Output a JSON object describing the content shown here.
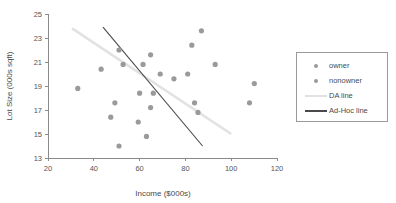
{
  "chart_data": {
    "type": "scatter",
    "title": "",
    "xlabel": "Income ($000s)",
    "ylabel": "Lot Size (000s sqft)",
    "xlim": [
      20,
      120
    ],
    "ylim": [
      13,
      25
    ],
    "xticks": [
      20,
      40,
      60,
      80,
      100,
      120
    ],
    "yticks": [
      13,
      15,
      17,
      19,
      21,
      23,
      25
    ],
    "grid": false,
    "legend_position": "right-outside",
    "series": [
      {
        "name": "owner",
        "marker": "circle",
        "color": "#9a9a9a",
        "points": [
          [
            60.0,
            18.4
          ],
          [
            85.5,
            16.8
          ],
          [
            64.8,
            21.6
          ],
          [
            61.5,
            20.8
          ],
          [
            87.0,
            23.6
          ],
          [
            110.1,
            19.2
          ],
          [
            108.0,
            17.6
          ],
          [
            82.8,
            22.4
          ],
          [
            69.0,
            20.0
          ],
          [
            93.0,
            20.8
          ],
          [
            51.0,
            22.0
          ],
          [
            81.0,
            20.0
          ]
        ]
      },
      {
        "name": "nonowner",
        "marker": "circle",
        "color": "#9a9a9a",
        "points": [
          [
            75.0,
            19.6
          ],
          [
            52.8,
            20.8
          ],
          [
            64.8,
            17.2
          ],
          [
            43.2,
            20.4
          ],
          [
            84.0,
            17.6
          ],
          [
            49.2,
            17.6
          ],
          [
            59.4,
            16.0
          ],
          [
            66.0,
            18.4
          ],
          [
            47.4,
            16.4
          ],
          [
            33.0,
            18.8
          ],
          [
            51.0,
            14.0
          ],
          [
            63.0,
            14.8
          ]
        ]
      }
    ],
    "lines": [
      {
        "name": "DA line",
        "color": "#e2e2e2",
        "width": 2.6,
        "x0": 30.5,
        "y0": 23.8,
        "x1": 100.0,
        "y1": 15.0
      },
      {
        "name": "Ad-Hoc line",
        "color": "#4a4a4a",
        "width": 1.1,
        "x0": 44.0,
        "y0": 23.9,
        "x1": 87.5,
        "y1": 14.0
      }
    ]
  },
  "legend": {
    "items": [
      {
        "label": "owner",
        "key": "dot",
        "color": "#9a9a9a"
      },
      {
        "label": "nonowner",
        "key": "dot",
        "color": "#9a9a9a"
      },
      {
        "label": "DA line",
        "key": "line",
        "color": "#e2e2e2"
      },
      {
        "label": "Ad-Hoc line",
        "key": "line",
        "color": "#4a4a4a"
      }
    ]
  }
}
